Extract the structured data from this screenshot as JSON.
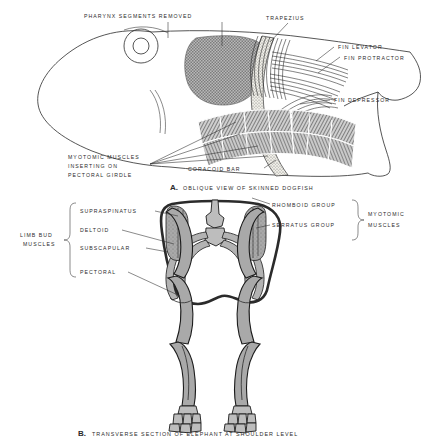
{
  "figure": {
    "background_color": "#ffffff",
    "ink_color": "#2b2b2b",
    "shade_gray": "#9a9a9a",
    "bone_gray": "#a9a9a9"
  },
  "panel_a": {
    "caption_letter": "A.",
    "caption_text": "OBLIQUE  VIEW  OF  SKINNED  DOGFISH",
    "labels": {
      "pharynx": "PHARYNX  SEGMENTS  REMOVED",
      "trapezius": "TRAPEZIUS",
      "fin_levator": "FIN LEVATOR",
      "fin_protractor": "FIN PROTRACTOR",
      "fin_depressor": "FIN DEPRESSOR",
      "coracoid_bar": "CORACOID BAR",
      "myotomic_line1": "MYOTOMIC MUSCLES",
      "myotomic_line2": "INSERTING ON",
      "myotomic_line3": "PECTORAL GIRDLE"
    }
  },
  "panel_b": {
    "caption_letter": "B.",
    "caption_text": "TRANSVERSE  SECTION  OF  ELEPHANT  AT  SHOULDER  LEVEL",
    "left_group": {
      "bracket_label_line1": "LIMB BUD",
      "bracket_label_line2": "MUSCLES",
      "items": [
        "SUPRASPINATUS",
        "DELTOID",
        "SUBSCAPULAR",
        "PECTORAL"
      ]
    },
    "right_group": {
      "bracket_label_line1": "MYOTOMIC",
      "bracket_label_line2": "MUSCLES",
      "items": [
        "RHOMBOID GROUP",
        "SERRATUS GROUP"
      ]
    }
  }
}
